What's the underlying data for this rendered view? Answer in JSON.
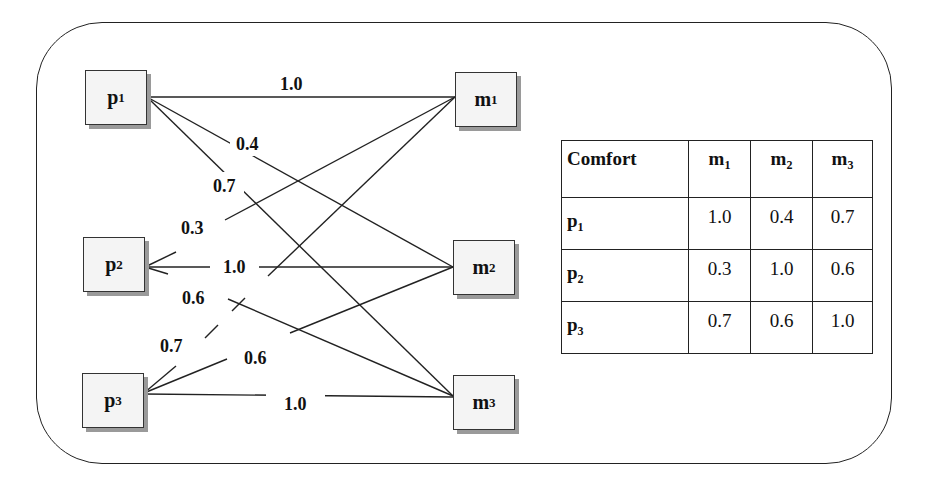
{
  "diagram": {
    "left_nodes": [
      {
        "id": "p1",
        "base": "p",
        "sub": "1"
      },
      {
        "id": "p2",
        "base": "p",
        "sub": "2"
      },
      {
        "id": "p3",
        "base": "p",
        "sub": "3"
      }
    ],
    "right_nodes": [
      {
        "id": "m1",
        "base": "m",
        "sub": "1"
      },
      {
        "id": "m2",
        "base": "m",
        "sub": "2"
      },
      {
        "id": "m3",
        "base": "m",
        "sub": "3"
      }
    ],
    "edges": [
      {
        "from": "p1",
        "to": "m1",
        "label": "1.0"
      },
      {
        "from": "p1",
        "to": "m2",
        "label": "0.4"
      },
      {
        "from": "p1",
        "to": "m3",
        "label": "0.7"
      },
      {
        "from": "m1",
        "to": "p2",
        "label": "0.3"
      },
      {
        "from": "m2",
        "to": "p2",
        "label": "1.0"
      },
      {
        "from": "m3",
        "to": "p2",
        "label": "0.6"
      },
      {
        "from": "m1",
        "to": "p3",
        "label": "0.7"
      },
      {
        "from": "m2",
        "to": "p3",
        "label": "0.6"
      },
      {
        "from": "p3",
        "to": "m3",
        "label": "1.0"
      }
    ]
  },
  "table": {
    "corner_header": "Comfort",
    "columns": [
      {
        "base": "m",
        "sub": "1"
      },
      {
        "base": "m",
        "sub": "2"
      },
      {
        "base": "m",
        "sub": "3"
      }
    ],
    "rows": [
      {
        "base": "p",
        "sub": "1",
        "values": [
          "1.0",
          "0.4",
          "0.7"
        ]
      },
      {
        "base": "p",
        "sub": "2",
        "values": [
          "0.3",
          "1.0",
          "0.6"
        ]
      },
      {
        "base": "p",
        "sub": "3",
        "values": [
          "0.7",
          "0.6",
          "1.0"
        ]
      }
    ]
  },
  "colors": {
    "line": "#222222",
    "node_fill": "#f4f4f4",
    "node_shadow": "#9a9a9a"
  }
}
